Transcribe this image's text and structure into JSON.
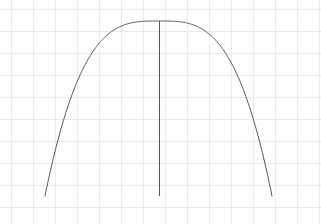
{
  "figure": {
    "title": "",
    "title_color": "#f2f2f4",
    "background_color": "#ffffff",
    "width": 321,
    "height": 224
  },
  "grid": {
    "visible": true,
    "color": "#e9e9ee",
    "line_width": 1,
    "spacing_px": 22,
    "x_origin_px": 11,
    "y_origin_px": 9,
    "x_lines_px": [
      11,
      33,
      55,
      77,
      99,
      121,
      143,
      165,
      187,
      209,
      231,
      253,
      275,
      297,
      319
    ],
    "y_lines_px": [
      9,
      31,
      53,
      75,
      97,
      119,
      141,
      163,
      185,
      207
    ]
  },
  "chart_data": {
    "type": "line",
    "title": "",
    "xlabel": "",
    "ylabel": "",
    "grid": true,
    "legend": null,
    "xlim": [
      45,
      272
    ],
    "ylim": [
      21,
      196
    ],
    "series": [
      {
        "name": "arch-curve",
        "color": "#555558",
        "line_width": 1,
        "apex_px": [
          159,
          21
        ],
        "left_end_px": [
          45,
          196
        ],
        "right_end_px": [
          272,
          196
        ],
        "shape": "flat-top-arch",
        "exponent": 3.2,
        "x": [
          45,
          56,
          68,
          79,
          91,
          102,
          113,
          125,
          136,
          148,
          159,
          170,
          182,
          193,
          205,
          216,
          227,
          239,
          250,
          261,
          272
        ],
        "y": [
          196,
          172,
          150,
          131,
          113,
          98,
          84,
          72,
          61,
          52,
          21,
          52,
          61,
          72,
          84,
          98,
          113,
          131,
          150,
          172,
          196
        ]
      },
      {
        "name": "center-axis-line",
        "color": "#555558",
        "line_width": 1,
        "orientation": "vertical",
        "x_px": 159,
        "y_top_px": 21,
        "y_bottom_px": 196
      }
    ]
  }
}
